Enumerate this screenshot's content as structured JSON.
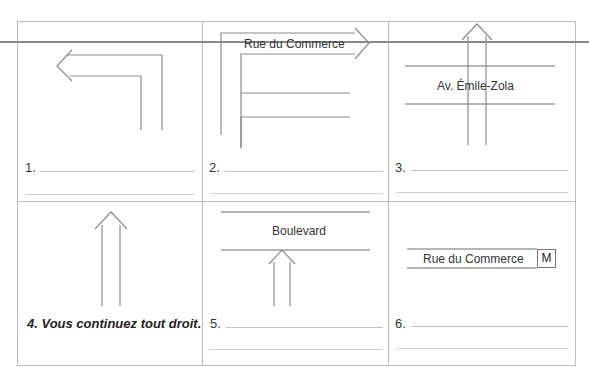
{
  "exercise": {
    "cells": [
      {
        "number": "1.",
        "street_label": ""
      },
      {
        "number": "2.",
        "street_label": "Rue du Commerce"
      },
      {
        "number": "3.",
        "street_label": "Av. Émile-Zola"
      },
      {
        "number": "4.",
        "example_answer": "4. Vous continuez tout droit."
      },
      {
        "number": "5.",
        "street_label": "Boulevard"
      },
      {
        "number": "6.",
        "street_label": "Rue du Commerce",
        "metro_sign": "M"
      }
    ]
  },
  "colors": {
    "grid_border": "#bdbdbd",
    "arrow_stroke": "#8c8c8c",
    "street_line": "#6e6e6e",
    "answer_line": "#c4c4c4"
  }
}
